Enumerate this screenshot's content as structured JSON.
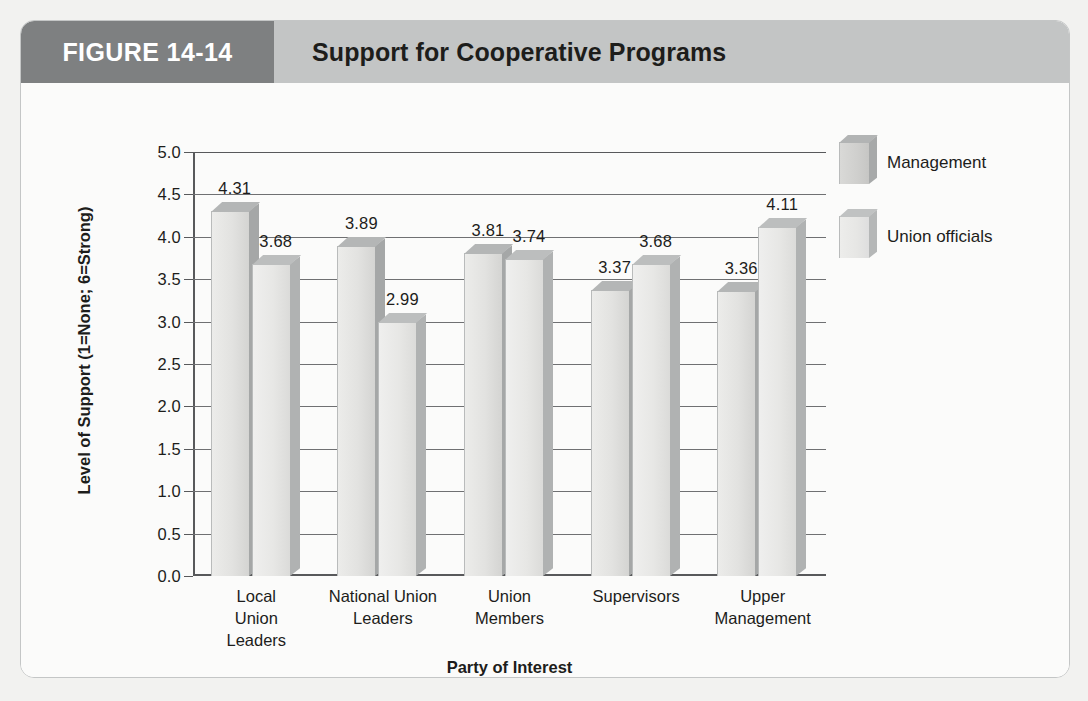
{
  "figure": {
    "number_label": "FIGURE 14-14",
    "title": "Support for Cooperative Programs"
  },
  "legend": {
    "position": "right",
    "items": [
      {
        "label": "Management",
        "swatch": "management-swatch",
        "color": "#cfcfcd"
      },
      {
        "label": "Union officials",
        "swatch": "union-officials-swatch",
        "color": "#e6e6e4"
      }
    ]
  },
  "axes": {
    "y_title": "Level of Support (1=None; 6=Strong)",
    "x_title": "Party of Interest",
    "y_ticks": [
      "5.0",
      "4.5",
      "4.0",
      "3.5",
      "3.0",
      "2.5",
      "2.0",
      "1.5",
      "1.0",
      "0.5",
      "0.0"
    ]
  },
  "chart_data": {
    "type": "bar",
    "title": "Support for Cooperative Programs",
    "xlabel": "Party of Interest",
    "ylabel": "Level of Support (1=None; 6=Strong)",
    "ylim": [
      0.0,
      5.0
    ],
    "ytick_step": 0.5,
    "grid": true,
    "legend_position": "right",
    "categories": [
      "Local Union Leaders",
      "National Union Leaders",
      "Union Members",
      "Supervisors",
      "Upper Management"
    ],
    "category_lines": [
      [
        "Local",
        "Union",
        "Leaders"
      ],
      [
        "National Union",
        "Leaders"
      ],
      [
        "Union",
        "Members"
      ],
      [
        "Supervisors"
      ],
      [
        "Upper",
        "Management"
      ]
    ],
    "series": [
      {
        "name": "Management",
        "color": "#e2e2e0",
        "values": [
          4.31,
          3.89,
          3.81,
          3.37,
          3.36
        ],
        "labels": [
          "4.31",
          "3.89",
          "3.81",
          "3.37",
          "3.36"
        ]
      },
      {
        "name": "Union officials",
        "color": "#e7e7e5",
        "values": [
          3.68,
          2.99,
          3.74,
          3.68,
          4.11
        ],
        "labels": [
          "3.68",
          "2.99",
          "3.74",
          "3.68",
          "4.11"
        ]
      }
    ]
  }
}
